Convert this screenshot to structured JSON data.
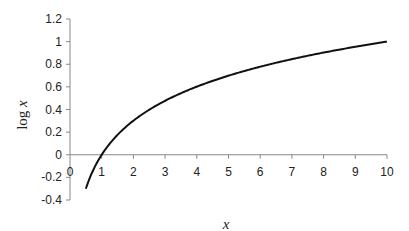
{
  "chart_data": {
    "type": "line",
    "title": "",
    "xlabel": "x",
    "ylabel": "log x",
    "xlim": [
      0,
      10
    ],
    "ylim": [
      -0.4,
      1.2
    ],
    "grid": false,
    "legend": null,
    "x_ticks": [
      "0",
      "1",
      "2",
      "3",
      "4",
      "5",
      "6",
      "7",
      "8",
      "9",
      "10"
    ],
    "y_ticks": [
      "1.2",
      "1",
      "0.8",
      "0.6",
      "0.4",
      "0.2",
      "0",
      "-0.2",
      "-0.4"
    ],
    "series": [
      {
        "name": "log x",
        "color": "#111111",
        "x": [
          0.5,
          0.75,
          1,
          1.5,
          2,
          2.5,
          3,
          4,
          5,
          6,
          7,
          8,
          9,
          10
        ],
        "y": [
          -0.301,
          -0.125,
          0,
          0.176,
          0.301,
          0.398,
          0.477,
          0.602,
          0.699,
          0.778,
          0.845,
          0.903,
          0.954,
          1.0
        ]
      }
    ]
  }
}
